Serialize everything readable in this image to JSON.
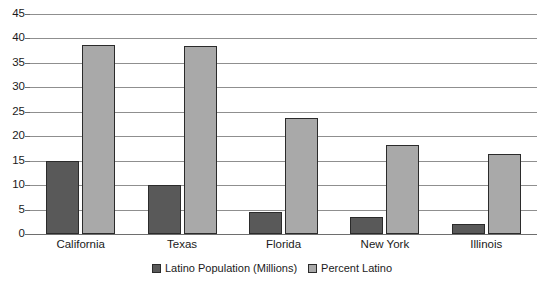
{
  "chart_data": {
    "type": "bar",
    "title": "",
    "xlabel": "",
    "ylabel": "",
    "ylim": [
      0,
      45
    ],
    "ytick_step": 5,
    "yticks": [
      "45",
      "40",
      "35",
      "30",
      "25",
      "20",
      "15",
      "10",
      "5",
      "0"
    ],
    "grid": true,
    "legend_position": "bottom",
    "categories": [
      "California",
      "Texas",
      "Florida",
      "New York",
      "Illinois"
    ],
    "series": [
      {
        "name": "Latino Population (Millions)",
        "color": "#595959",
        "values": [
          15.0,
          10.0,
          4.6,
          3.4,
          2.0
        ]
      },
      {
        "name": "Percent Latino",
        "color": "#a9a9a9",
        "values": [
          38.6,
          38.4,
          23.8,
          18.3,
          16.3
        ]
      }
    ]
  },
  "colors": {
    "series_dark": "#595959",
    "series_light": "#a9a9a9",
    "gridline": "#8f8f8f",
    "axis": "#6e6e6e",
    "bar_outline": "#2b2b2b",
    "text": "#1a1a1a",
    "background": "#ffffff"
  }
}
